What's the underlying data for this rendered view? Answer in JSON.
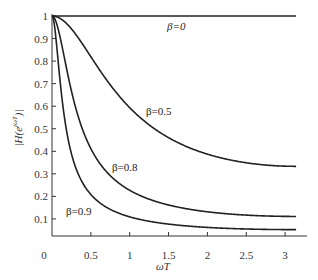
{
  "chart_data": {
    "type": "line",
    "title": "",
    "xlabel": "ωT",
    "ylabel": "|H(e^{jωT})|",
    "xlim": [
      0,
      3.3
    ],
    "ylim": [
      0,
      1
    ],
    "grid": false,
    "legend": "inline labels",
    "x_ticks": [
      "0",
      "0.5",
      "1",
      "1.5",
      "2",
      "2.5",
      "3"
    ],
    "y_ticks": [
      "0.1",
      "0.2",
      "0.3",
      "0.4",
      "0.5",
      "0.6",
      "0.7",
      "0.8",
      "0.9",
      "1"
    ],
    "x": [
      0,
      0.25,
      0.5,
      0.75,
      1.0,
      1.25,
      1.5,
      1.75,
      2.0,
      2.25,
      2.5,
      2.75,
      3.0,
      3.1416
    ],
    "series": [
      {
        "name": "β=0",
        "label": "β=0",
        "values": [
          1,
          1,
          1,
          1,
          1,
          1,
          1,
          1,
          1,
          1,
          1,
          1,
          1,
          1
        ]
      },
      {
        "name": "β=0.5",
        "label": "β=0.5",
        "values": [
          1,
          0.92,
          0.77,
          0.64,
          0.54,
          0.47,
          0.42,
          0.39,
          0.37,
          0.35,
          0.34,
          0.337,
          0.334,
          0.333
        ]
      },
      {
        "name": "β=0.8",
        "label": "β=0.8",
        "values": [
          1,
          0.62,
          0.38,
          0.27,
          0.21,
          0.17,
          0.15,
          0.14,
          0.13,
          0.12,
          0.116,
          0.113,
          0.111,
          0.111
        ]
      },
      {
        "name": "β=0.9",
        "label": "β=0.9",
        "values": [
          1,
          0.37,
          0.2,
          0.14,
          0.11,
          0.09,
          0.08,
          0.07,
          0.064,
          0.06,
          0.057,
          0.054,
          0.053,
          0.053
        ]
      }
    ],
    "formula_params": {
      "betas": [
        0,
        0.5,
        0.8,
        0.9
      ]
    }
  },
  "labels": {
    "xlabel": "ωT",
    "ylabel_main": "|H(e",
    "ylabel_sup": "jωT",
    "ylabel_tail": ")|",
    "origin": "0",
    "beta0": "β=0",
    "beta05": "β=0.5",
    "beta08": "β=0.8",
    "beta09": "β=0.9"
  },
  "colors": {
    "curve": "#222222",
    "axis": "#333333",
    "text": "#333333"
  }
}
